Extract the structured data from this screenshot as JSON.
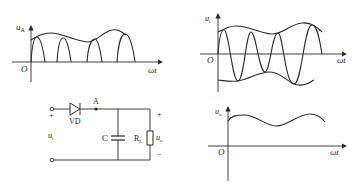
{
  "figure": {
    "plots": {
      "uA": {
        "ylabel": "u",
        "ylabel_sub": "A",
        "origin": "O",
        "xlabel": "ωt"
      },
      "ui": {
        "ylabel": "u",
        "ylabel_sub": "i",
        "origin": "O",
        "xlabel": "ωt"
      },
      "uo": {
        "ylabel": "u",
        "ylabel_sub": "o",
        "origin": "O",
        "xlabel": "ωt"
      }
    },
    "circuit": {
      "diode_label": "VD",
      "node_label": "A",
      "capacitor_label": "C",
      "load_label": "R",
      "load_label_sub": "L",
      "input_label": "u",
      "input_label_sub": "i",
      "output_label": "u",
      "output_label_sub": "o",
      "plus": "+",
      "minus": "−"
    }
  },
  "colors": {
    "line": "#2b2b2b",
    "background": "#ffffff"
  }
}
